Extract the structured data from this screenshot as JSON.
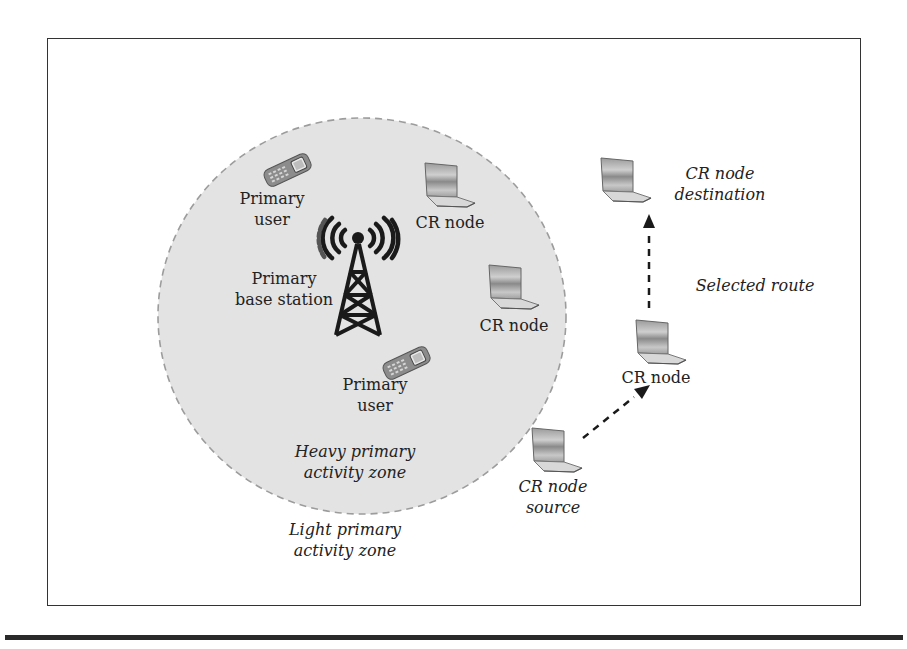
{
  "diagram": {
    "zones": {
      "heavy": {
        "label_line1": "Heavy primary",
        "label_line2": "activity zone",
        "fill": "#e4e4e4",
        "border": "#9a9a9a"
      },
      "light": {
        "label_line1": "Light primary",
        "label_line2": "activity zone"
      }
    },
    "primary_users": [
      {
        "label_line1": "Primary",
        "label_line2": "user"
      },
      {
        "label_line1": "Primary",
        "label_line2": "user"
      }
    ],
    "base_station": {
      "label_line1": "Primary",
      "label_line2": "base station"
    },
    "cr_nodes": [
      {
        "label": "CR node"
      },
      {
        "label": "CR node"
      },
      {
        "label": "CR node"
      }
    ],
    "destination": {
      "label_line1": "CR node",
      "label_line2": "destination"
    },
    "source": {
      "label_line1": "CR node",
      "label_line2": "source"
    },
    "route": {
      "label": "Selected route"
    },
    "icons": {
      "phone": "mobile-phone-icon",
      "laptop": "laptop-icon",
      "tower": "radio-tower-icon"
    }
  }
}
